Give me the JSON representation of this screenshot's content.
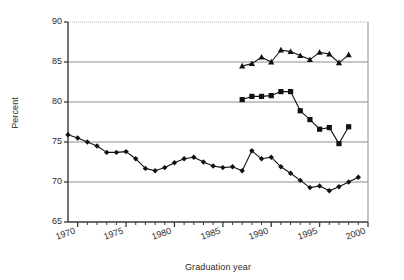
{
  "chart_data": {
    "type": "line",
    "title": "",
    "xlabel": "Graduation year",
    "ylabel": "Percent",
    "xlim": [
      1969,
      2000
    ],
    "ylim": [
      65,
      90
    ],
    "yticks": [
      65,
      70,
      75,
      80,
      85,
      90
    ],
    "xticks": [
      1970,
      1975,
      1980,
      1985,
      1990,
      1995,
      2000
    ],
    "xtick_labels": [
      "1970",
      "1975",
      "1980",
      "1985",
      "1990",
      "1995",
      "2000"
    ],
    "ytick_labels": [
      "65",
      "70",
      "75",
      "80",
      "85",
      "90"
    ],
    "grid": "horizontal",
    "legend": "none",
    "minor_xticks_every": 1,
    "series": [
      {
        "name": "triangle-series",
        "marker": "triangle",
        "color": "#111111",
        "x": [
          1987,
          1988,
          1989,
          1990,
          1991,
          1992,
          1993,
          1994,
          1995,
          1996,
          1997,
          1998
        ],
        "values": [
          84.5,
          84.8,
          85.6,
          85.0,
          86.5,
          86.3,
          85.8,
          85.3,
          86.2,
          86.0,
          84.9,
          85.9
        ]
      },
      {
        "name": "square-series",
        "marker": "square",
        "color": "#111111",
        "x": [
          1987,
          1988,
          1989,
          1990,
          1991,
          1992,
          1993,
          1994,
          1995,
          1996,
          1997,
          1998
        ],
        "values": [
          80.3,
          80.7,
          80.7,
          80.8,
          81.3,
          81.3,
          78.9,
          77.8,
          76.6,
          76.8,
          74.8,
          76.9
        ]
      },
      {
        "name": "diamond-series",
        "marker": "diamond",
        "color": "#111111",
        "x": [
          1969,
          1970,
          1971,
          1972,
          1973,
          1974,
          1975,
          1976,
          1977,
          1978,
          1979,
          1980,
          1981,
          1982,
          1983,
          1984,
          1985,
          1986,
          1987,
          1988,
          1989,
          1990,
          1991,
          1992,
          1993,
          1994,
          1995,
          1996,
          1997,
          1998,
          1999
        ],
        "values": [
          75.9,
          75.5,
          75.0,
          74.5,
          73.7,
          73.7,
          73.8,
          72.9,
          71.7,
          71.4,
          71.8,
          72.4,
          72.9,
          73.1,
          72.5,
          72.0,
          71.8,
          71.9,
          71.4,
          73.9,
          72.9,
          73.1,
          71.9,
          71.1,
          70.2,
          69.3,
          69.5,
          68.9,
          69.4,
          70.0,
          70.6
        ]
      }
    ]
  }
}
